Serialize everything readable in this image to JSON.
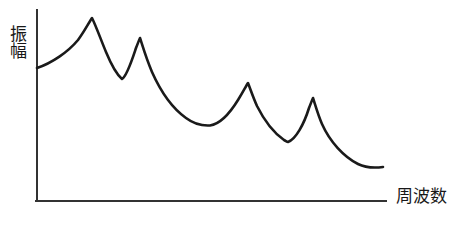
{
  "figure": {
    "background_color": "#ffffff",
    "width": 458,
    "height": 228
  },
  "axes": {
    "y_label": "振幅",
    "x_label": "周波数",
    "axis_color": "#333333",
    "axis_line_width": 2,
    "y_axis": {
      "x": 37,
      "y_top": 10,
      "y_bottom": 201
    },
    "x_axis": {
      "y": 201,
      "x_left": 37,
      "x_right": 386
    }
  },
  "curve": {
    "color": "#1a1a1a",
    "line_width": 2.6,
    "path": "M 37,68 C 52,63 68,52 78,40 C 84,32 88,24 92,18 C 96,26 101,40 106,52 C 111,64 116,74 122,79 C 127,76 132,60 136,48 C 138,43 139,40 140,38 C 142,44 146,58 152,72 C 160,90 172,108 186,118 C 194,124 202,126 210,125.5 C 220,124 230,113 238,100 C 243,92 246,86 248,83 C 250,88 253,97 257,106 C 264,120 274,133 284,140 C 286,141 287,142 288,142 C 296,139 304,124 309,108 C 311,103 312,100 313,98 C 315,104 318,115 322,124 C 330,142 344,157 358,164 C 366,168 375,168 383,167"
  },
  "chart_data": {
    "type": "line",
    "title": "",
    "xlabel": "周波数",
    "ylabel": "振幅",
    "grid": false,
    "legend": null,
    "axis_ticks": {
      "x": [],
      "y": []
    },
    "series": [
      {
        "name": "振幅",
        "points": [
          {
            "x": 37,
            "y": 68,
            "role": "start"
          },
          {
            "x": 92,
            "y": 18,
            "role": "peak",
            "peak_index": 1
          },
          {
            "x": 122,
            "y": 79,
            "role": "valley",
            "valley_index": 1
          },
          {
            "x": 140,
            "y": 38,
            "role": "peak",
            "peak_index": 2
          },
          {
            "x": 210,
            "y": 126,
            "role": "valley",
            "valley_index": 2
          },
          {
            "x": 248,
            "y": 83,
            "role": "peak",
            "peak_index": 3
          },
          {
            "x": 288,
            "y": 142,
            "role": "valley",
            "valley_index": 3
          },
          {
            "x": 313,
            "y": 98,
            "role": "peak",
            "peak_index": 4
          },
          {
            "x": 383,
            "y": 167,
            "role": "end"
          }
        ]
      }
    ],
    "peak_count": 4,
    "valley_count": 3
  }
}
